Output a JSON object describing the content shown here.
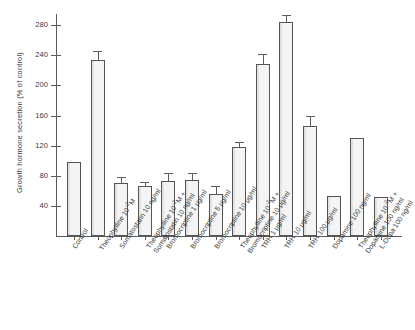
{
  "chart": {
    "type": "bar",
    "ylabel": "Growth hormone secretion (% of control)",
    "xlabel": "",
    "title": ""
  },
  "chart_data": {
    "type": "bar",
    "title": "",
    "xlabel": "",
    "ylabel": "Growth hormone secretion (% of control)",
    "ylim": [
      0,
      295
    ],
    "yticks": [
      40,
      80,
      120,
      160,
      200,
      240,
      280
    ],
    "grid": false,
    "legend": null,
    "categories": [
      "Control",
      "Theophylline 10⁻²M",
      "Somatostatin 10 ng/ml",
      "Theophylline 10⁻²M + Somatostatin 10 ng/ml",
      "Bromocriptine 1 μg/ml",
      "Bromocriptine 5 μg/ml",
      "Bromocriptine 10 μg/ml",
      "Theophylline 10⁻²M + Bromocriptine 10 μg/ml",
      "TRH 1 μg/ml",
      "TRH 10 μg/ml",
      "TRH 100 μg/ml",
      "Dopamine 100 ng/ml",
      "Theophylline 10⁻²M + Dopamine 100 ng/ml",
      "L-Dopa 100 ng/ml"
    ],
    "values": [
      99,
      234,
      71,
      66,
      73,
      74,
      56,
      118,
      228,
      285,
      146,
      53,
      130,
      52
    ],
    "errors": [
      0,
      10,
      6,
      4,
      9,
      9,
      9,
      5,
      13,
      8,
      12,
      0,
      0,
      0
    ]
  },
  "axis": {
    "ticks": [
      {
        "label": "280",
        "value": 280
      },
      {
        "label": "240",
        "value": 240
      },
      {
        "label": "200",
        "value": 200
      },
      {
        "label": "160",
        "value": 160
      },
      {
        "label": "120",
        "value": 120
      },
      {
        "label": "80",
        "value": 80
      },
      {
        "label": "40",
        "value": 40
      }
    ]
  },
  "bars": [
    {
      "name": "bar-control",
      "line1": "Control",
      "line2": "",
      "value": 99,
      "error": 0
    },
    {
      "name": "bar-theophylline",
      "line1": "Theophylline 10⁻²M",
      "line2": "",
      "value": 234,
      "error": 10
    },
    {
      "name": "bar-somatostatin-10",
      "line1": "Somatostatin 10 ng/ml",
      "line2": "",
      "value": 71,
      "error": 6
    },
    {
      "name": "bar-theophylline-somatostatin",
      "line1": "Theophylline 10⁻²M +",
      "line2": "Somatostatin 10 ng/ml",
      "value": 66,
      "error": 4
    },
    {
      "name": "bar-bromocriptine-1",
      "line1": "Bromocriptine 1 μg/ml",
      "line2": "",
      "value": 73,
      "error": 9
    },
    {
      "name": "bar-bromocriptine-5",
      "line1": "Bromocriptine 5 μg/ml",
      "line2": "",
      "value": 74,
      "error": 9
    },
    {
      "name": "bar-bromocriptine-10",
      "line1": "Bromocriptine 10 μg/ml",
      "line2": "",
      "value": 56,
      "error": 9
    },
    {
      "name": "bar-theophylline-bromocriptine",
      "line1": "Theophylline 10⁻²M +",
      "line2": "Bromocriptine 10 μg/ml",
      "value": 118,
      "error": 5
    },
    {
      "name": "bar-trh-1",
      "line1": "TRH 1 μg/ml",
      "line2": "",
      "value": 228,
      "error": 13
    },
    {
      "name": "bar-trh-10",
      "line1": "TRH 10 μg/ml",
      "line2": "",
      "value": 285,
      "error": 8
    },
    {
      "name": "bar-trh-100",
      "line1": "TRH 100 μg/ml",
      "line2": "",
      "value": 146,
      "error": 12
    },
    {
      "name": "bar-dopamine-100",
      "line1": "Dopamine 100 ng/ml",
      "line2": "",
      "value": 53,
      "error": 0
    },
    {
      "name": "bar-theophylline-dopamine",
      "line1": "Theophylline 10⁻²M +",
      "line2": "Dopamine 100 ng/ml",
      "value": 130,
      "error": 0
    },
    {
      "name": "bar-l-dopa-100",
      "line1": "L-Dopa 100 ng/ml",
      "line2": "",
      "value": 52,
      "error": 0
    }
  ]
}
